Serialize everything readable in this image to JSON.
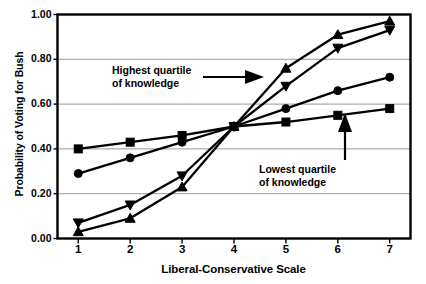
{
  "chart_data": {
    "type": "line",
    "title": "",
    "xlabel": "Liberal-Conservative Scale",
    "ylabel": "Probability of Voting for Bush",
    "x": [
      1,
      2,
      3,
      4,
      5,
      6,
      7
    ],
    "xtick_labels": [
      "1",
      "2",
      "3",
      "4",
      "5",
      "6",
      "7"
    ],
    "ytick_labels": [
      "0.00",
      "0.20",
      "0.40",
      "0.60",
      "0.80",
      "1.00"
    ],
    "ytick_values": [
      0.0,
      0.2,
      0.4,
      0.6,
      0.8,
      1.0
    ],
    "xlim": [
      0.6,
      7.4
    ],
    "ylim": [
      0.0,
      1.0
    ],
    "grid": "horizontal",
    "legend": "none",
    "series": [
      {
        "name": "Lowest quartile of knowledge",
        "marker": "square",
        "values": [
          0.4,
          0.43,
          0.46,
          0.5,
          0.52,
          0.55,
          0.58
        ]
      },
      {
        "name": "Second quartile of knowledge",
        "marker": "circle",
        "values": [
          0.29,
          0.36,
          0.43,
          0.5,
          0.58,
          0.66,
          0.72
        ]
      },
      {
        "name": "Third quartile of knowledge",
        "marker": "triangle-down",
        "values": [
          0.07,
          0.15,
          0.28,
          0.5,
          0.68,
          0.85,
          0.93
        ]
      },
      {
        "name": "Highest quartile of knowledge",
        "marker": "triangle-up",
        "values": [
          0.03,
          0.09,
          0.23,
          0.5,
          0.76,
          0.91,
          0.97
        ]
      }
    ],
    "annotations": [
      {
        "id": "highest",
        "line1": "Highest quartile",
        "line2": "of knowledge",
        "arrow": "right"
      },
      {
        "id": "lowest",
        "line1": "Lowest quartile",
        "line2": "of knowledge",
        "arrow": "up"
      }
    ],
    "colors": {
      "line": "#000000",
      "grid": "#8c8c8c",
      "axis": "#000000",
      "background": "#ffffff"
    }
  }
}
